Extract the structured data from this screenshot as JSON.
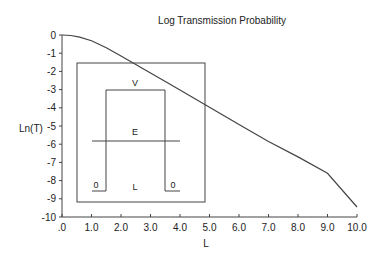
{
  "chart_data": {
    "type": "line",
    "title": "Log Transmission Probability",
    "xlabel": "L",
    "ylabel": "Ln(T)",
    "xlim": [
      0,
      10
    ],
    "ylim": [
      -10,
      0
    ],
    "x_ticks": [
      ".0",
      "1.0",
      "2.0",
      "3.0",
      "4.0",
      "5.0",
      "6.0",
      "7.0",
      "8.0",
      "9.0",
      "10.0"
    ],
    "y_ticks": [
      "0",
      "-1",
      "-2",
      "-3",
      "-4",
      "-5",
      "-6",
      "-7",
      "-8",
      "-9",
      "-10"
    ],
    "grid": false,
    "series": [
      {
        "name": "Ln(T)",
        "x": [
          0,
          0.3,
          0.6,
          1.0,
          1.5,
          2.0,
          2.5,
          3.0,
          3.5,
          4.0,
          5.0,
          6.0,
          7.0,
          8.0,
          9.0,
          10.0
        ],
        "y": [
          0,
          -0.03,
          -0.12,
          -0.32,
          -0.7,
          -1.15,
          -1.62,
          -2.08,
          -2.55,
          -3.02,
          -3.97,
          -4.92,
          -5.85,
          -6.7,
          -7.6,
          -9.45
        ]
      }
    ],
    "inset": {
      "description": "Potential barrier diagram",
      "labels": {
        "barrier_height": "V",
        "energy": "E",
        "width": "L",
        "left_zero": "0",
        "right_zero": "0"
      }
    }
  }
}
